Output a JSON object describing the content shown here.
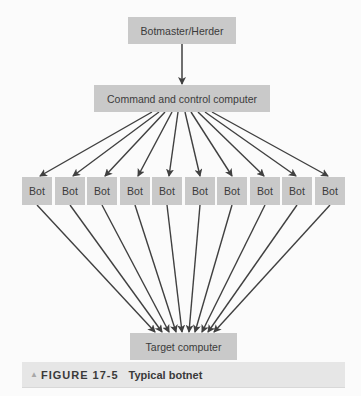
{
  "diagram": {
    "botmaster": {
      "label": "Botmaster/Herder"
    },
    "cnc": {
      "label": "Command and control computer"
    },
    "bots": [
      {
        "label": "Bot"
      },
      {
        "label": "Bot"
      },
      {
        "label": "Bot"
      },
      {
        "label": "Bot"
      },
      {
        "label": "Bot"
      },
      {
        "label": "Bot"
      },
      {
        "label": "Bot"
      },
      {
        "label": "Bot"
      },
      {
        "label": "Bot"
      },
      {
        "label": "Bot"
      }
    ],
    "target": {
      "label": "Target computer"
    },
    "edges": [
      {
        "from": "Botmaster/Herder",
        "to": "Command and control computer"
      },
      {
        "from": "Command and control computer",
        "to": "each Bot (10)"
      },
      {
        "from": "each Bot (10)",
        "to": "Target computer"
      }
    ],
    "colors": {
      "node_fill": "#c9c9c9",
      "arrow": "#404040",
      "caption_fill": "#e6e6e6"
    }
  },
  "caption": {
    "marker_icon": "triangle-up-icon",
    "figure_label": "FIGURE 17-5",
    "title": "Typical botnet"
  }
}
